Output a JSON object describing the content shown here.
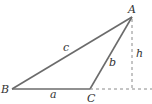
{
  "diagram": {
    "vertices": {
      "A": {
        "label": "A",
        "x": 132,
        "y": 17
      },
      "B": {
        "label": "B",
        "x": 12,
        "y": 89
      },
      "C": {
        "label": "C",
        "x": 90,
        "y": 89
      }
    },
    "sides": {
      "a": {
        "label": "a",
        "from": "B",
        "to": "C"
      },
      "b": {
        "label": "b",
        "from": "C",
        "to": "A"
      },
      "c": {
        "label": "c",
        "from": "B",
        "to": "A"
      }
    },
    "altitude": {
      "label": "h",
      "from": "A",
      "foot_x": 132,
      "foot_y": 89
    },
    "colors": {
      "stroke": "#6b6b6b",
      "dashed": "#8a8a8a",
      "text": "#333333"
    }
  }
}
